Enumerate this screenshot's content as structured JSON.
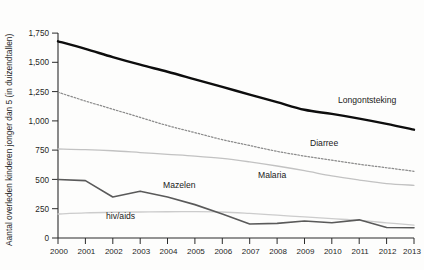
{
  "figure": {
    "cropped_title_fragment": "",
    "yaxis_title": "Aantal overleden kinderen jonger dan 5 (in duizendtallen)"
  },
  "labels": {
    "longontsteking": "Longontsteking",
    "diarree": "Diarree",
    "malaria": "Malaria",
    "mazelen": "Mazelen",
    "hivaids": "hiv/aids"
  },
  "ticks": {
    "y": [
      "1,750",
      "1,500",
      "1,250",
      "1,000",
      "750",
      "500",
      "250",
      "0"
    ],
    "x": [
      "2000",
      "2001",
      "2002",
      "2003",
      "2004",
      "2005",
      "2006",
      "2007",
      "2008",
      "2009",
      "2010",
      "2011",
      "2012",
      "2013"
    ]
  },
  "colors": {
    "longontsteking": "#0d0d0d",
    "diarree": "#8b8b8b",
    "malaria": "#c2c2c2",
    "mazelen": "#5a5a5a",
    "hivaids": "#cccccc",
    "axis": "#2b2b2b",
    "background": "#fdfdfc"
  },
  "chart_data": {
    "type": "line",
    "title": "",
    "xlabel": "",
    "ylabel": "Aantal overleden kinderen jonger dan 5 (in duizendtallen)",
    "x": [
      2000,
      2001,
      2002,
      2003,
      2004,
      2005,
      2006,
      2007,
      2008,
      2009,
      2010,
      2011,
      2012,
      2013
    ],
    "xlim": [
      2000,
      2013
    ],
    "ylim": [
      0,
      1750
    ],
    "yticks": [
      0,
      250,
      500,
      750,
      1000,
      1250,
      1500,
      1750
    ],
    "grid": false,
    "legend": "inline-labels",
    "series": [
      {
        "name": "Longontsteking",
        "style": "solid-thick-black",
        "values": [
          1680,
          1615,
          1545,
          1480,
          1420,
          1355,
          1290,
          1225,
          1160,
          1095,
          1060,
          1020,
          975,
          925
        ]
      },
      {
        "name": "Diarree",
        "style": "dotted-gray",
        "values": [
          1245,
          1170,
          1100,
          1030,
          960,
          900,
          840,
          790,
          740,
          700,
          665,
          630,
          600,
          570
        ]
      },
      {
        "name": "Malaria",
        "style": "solid-light-gray",
        "values": [
          760,
          755,
          745,
          730,
          715,
          700,
          680,
          650,
          615,
          575,
          530,
          495,
          465,
          450
        ]
      },
      {
        "name": "Mazelen",
        "style": "solid-medium-gray",
        "values": [
          500,
          490,
          350,
          400,
          350,
          285,
          205,
          120,
          125,
          145,
          130,
          155,
          90,
          88
        ]
      },
      {
        "name": "hiv/aids",
        "style": "solid-pale-gray",
        "values": [
          205,
          215,
          220,
          222,
          224,
          225,
          222,
          210,
          195,
          180,
          165,
          150,
          130,
          110
        ]
      }
    ]
  }
}
